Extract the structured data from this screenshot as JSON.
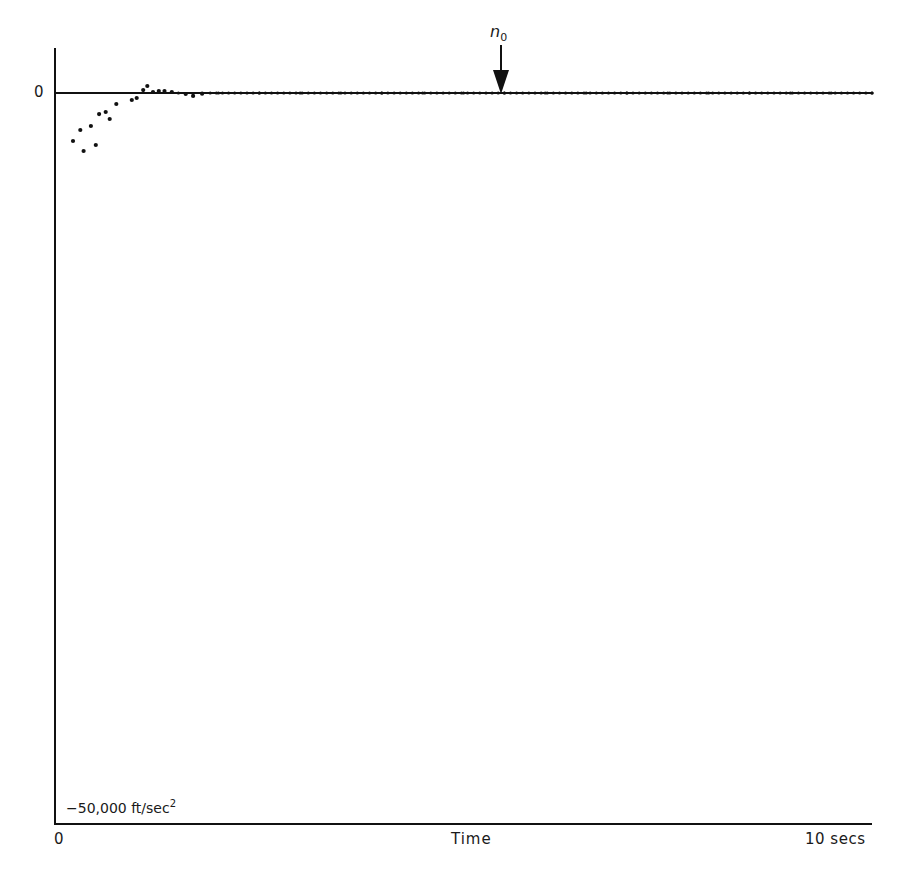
{
  "chart_data": {
    "type": "scatter",
    "title": "",
    "xlabel": "Time",
    "ylabel": "",
    "x_unit": "secs",
    "y_unit": "ft/sec^2",
    "xlim": [
      0,
      10
    ],
    "ylim": [
      -50000,
      3200
    ],
    "x_tick_labels": [
      "0",
      "10 secs"
    ],
    "y_tick_labels": [
      "0",
      "-50,000 ft/sec²"
    ],
    "grid": false,
    "legend": null,
    "reference_line": {
      "y": 0,
      "label": "0"
    },
    "annotations": [
      {
        "label": "n0",
        "x": 5.46,
        "y": 0,
        "type": "arrow-down"
      }
    ],
    "series": [
      {
        "name": "acceleration",
        "points": [
          {
            "x": 0.22,
            "y": -3280
          },
          {
            "x": 0.31,
            "y": -2530
          },
          {
            "x": 0.35,
            "y": -3970
          },
          {
            "x": 0.44,
            "y": -2260
          },
          {
            "x": 0.5,
            "y": -3560
          },
          {
            "x": 0.54,
            "y": -1440
          },
          {
            "x": 0.62,
            "y": -1300
          },
          {
            "x": 0.67,
            "y": -1780
          },
          {
            "x": 0.75,
            "y": -750
          },
          {
            "x": 0.94,
            "y": -480
          },
          {
            "x": 1.0,
            "y": -340
          },
          {
            "x": 1.08,
            "y": 200
          },
          {
            "x": 1.13,
            "y": 480
          },
          {
            "x": 1.2,
            "y": 70
          },
          {
            "x": 1.27,
            "y": 130
          },
          {
            "x": 1.34,
            "y": 130
          },
          {
            "x": 1.43,
            "y": 70
          },
          {
            "x": 1.51,
            "y": 0
          },
          {
            "x": 1.6,
            "y": -70
          },
          {
            "x": 1.69,
            "y": -200
          },
          {
            "x": 1.8,
            "y": -50
          },
          {
            "x": 2.0,
            "y": 0
          },
          {
            "x": 2.5,
            "y": 0
          },
          {
            "x": 3.0,
            "y": 0
          },
          {
            "x": 3.5,
            "y": 0
          },
          {
            "x": 4.0,
            "y": 0
          },
          {
            "x": 4.5,
            "y": 0
          },
          {
            "x": 5.0,
            "y": 0
          },
          {
            "x": 5.5,
            "y": 0
          },
          {
            "x": 6.0,
            "y": 0
          },
          {
            "x": 6.5,
            "y": 0
          },
          {
            "x": 7.0,
            "y": 0
          },
          {
            "x": 7.5,
            "y": 0
          },
          {
            "x": 8.0,
            "y": 0
          },
          {
            "x": 8.5,
            "y": 0
          },
          {
            "x": 9.0,
            "y": 0
          },
          {
            "x": 9.5,
            "y": 0
          },
          {
            "x": 10.0,
            "y": 0
          }
        ]
      }
    ]
  },
  "labels": {
    "y_zero": "0",
    "y_min": "−50,000 ft/sec",
    "y_min_exp": "2",
    "x_zero": "0",
    "x_label": "Time",
    "x_max": "10 secs",
    "arrow_label": "n",
    "arrow_sub": "0"
  },
  "colors": {
    "ink": "#111111",
    "background": "#ffffff"
  }
}
